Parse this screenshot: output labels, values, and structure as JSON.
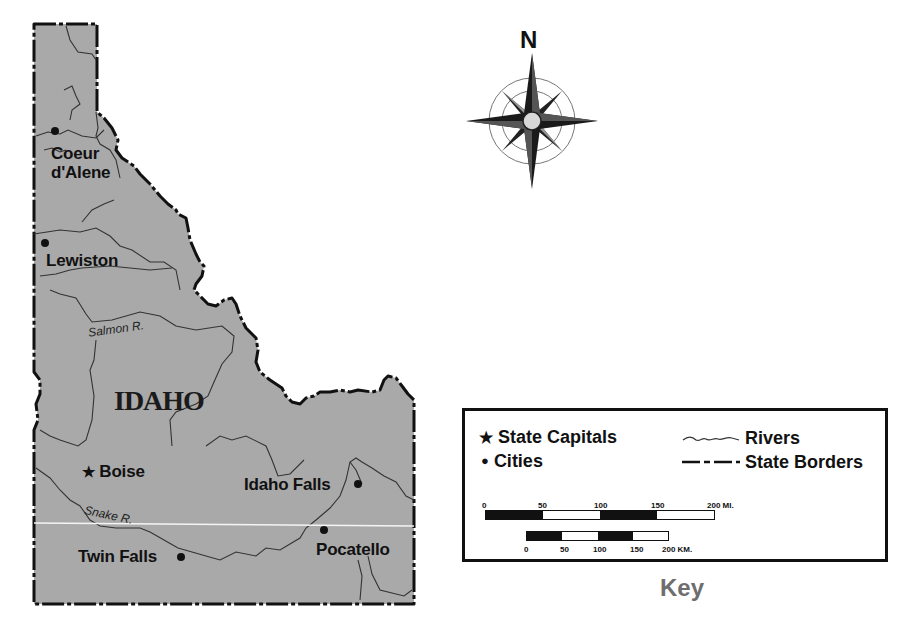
{
  "map": {
    "state_name": "IDAHO",
    "fill_color": "#a9a9a9",
    "border_color": "#111111",
    "river_color": "#333333",
    "cities": [
      {
        "name": "Coeur",
        "name_line2": "d'Alene",
        "type": "city"
      },
      {
        "name": "Lewiston",
        "type": "city"
      },
      {
        "name": "Boise",
        "type": "capital"
      },
      {
        "name": "Idaho Falls",
        "type": "city"
      },
      {
        "name": "Twin Falls",
        "type": "city"
      },
      {
        "name": "Pocatello",
        "type": "city"
      }
    ],
    "rivers": [
      {
        "name": "Salmon R."
      },
      {
        "name": "Snake R."
      }
    ]
  },
  "compass": {
    "north_label": "N",
    "icon": "compass-rose-icon"
  },
  "key": {
    "title": "Key",
    "items": {
      "capital": {
        "symbol": "★",
        "label": "State Capitals"
      },
      "city": {
        "symbol": "●",
        "label": "Cities"
      },
      "rivers": {
        "label": "Rivers"
      },
      "borders": {
        "label": "State Borders"
      }
    },
    "scale_miles": {
      "ticks": [
        "0",
        "50",
        "100",
        "150",
        "200 MI."
      ]
    },
    "scale_km": {
      "ticks": [
        "0",
        "50",
        "100",
        "150",
        "200 KM."
      ]
    }
  }
}
